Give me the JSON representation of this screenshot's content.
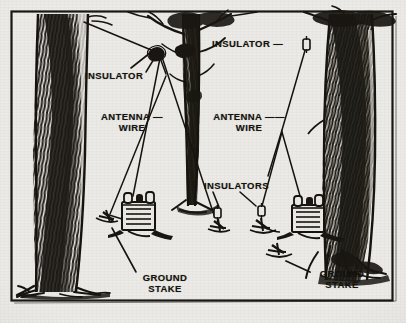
{
  "figure": {
    "background_color": "#eceae6",
    "ink_color": "#1a1814",
    "frame": {
      "color": "#1a1814"
    }
  },
  "labels": [
    {
      "id": "insulator-left",
      "name": "insulator-label-left",
      "text": "INSULATOR",
      "x": 85,
      "y": 70,
      "width": 72,
      "align": "left"
    },
    {
      "id": "insulator-right",
      "name": "insulator-label-right",
      "text": "INSULATOR —",
      "x": 212,
      "y": 38,
      "width": 90,
      "align": "left"
    },
    {
      "id": "antenna-wire-left",
      "name": "antenna-wire-label-left",
      "text": "ANTENNA —\nWIRE",
      "x": 92,
      "y": 111,
      "width": 74,
      "align": "center"
    },
    {
      "id": "antenna-wire-right",
      "name": "antenna-wire-label-right",
      "text": "ANTENNA ——\nWIRE",
      "x": 205,
      "y": 111,
      "width": 86,
      "align": "center"
    },
    {
      "id": "insulators-center",
      "name": "insulators-label",
      "text": "INSULATORS",
      "x": 204,
      "y": 180,
      "width": 80,
      "align": "left"
    },
    {
      "id": "ground-stake-left",
      "name": "ground-stake-label-left",
      "text": "GROUND\nSTAKE",
      "x": 133,
      "y": 277,
      "width": 62,
      "align": "center"
    },
    {
      "id": "ground-stake-right",
      "name": "ground-stake-label-right",
      "text": "GROUND\nSTAKE",
      "x": 312,
      "y": 272,
      "width": 62,
      "align": "center"
    }
  ],
  "scene": {
    "trees": [
      {
        "name": "tree-left",
        "role": "large foreground trunk, left support"
      },
      {
        "name": "tree-center",
        "role": "slender branching trunk, center support"
      },
      {
        "name": "tree-right",
        "role": "large trunk, right support"
      }
    ],
    "equipment": [
      {
        "name": "radio-transceiver-left",
        "role": "field radio set on ground, left"
      },
      {
        "name": "radio-transceiver-right",
        "role": "field radio set on ground, right"
      }
    ],
    "hardware": [
      {
        "name": "insulator-upper-left",
        "role": "wire insulator near left tree top"
      },
      {
        "name": "insulator-upper-right",
        "role": "wire insulator on right tree"
      },
      {
        "name": "insulator-lower-a",
        "role": "insulator above ground stake"
      },
      {
        "name": "insulator-lower-b",
        "role": "insulator above ground stake"
      },
      {
        "name": "ground-stake-1",
        "role": "stake driven into ground"
      },
      {
        "name": "ground-stake-2",
        "role": "stake driven into ground"
      },
      {
        "name": "ground-stake-3",
        "role": "stake driven into ground"
      },
      {
        "name": "ground-stake-4",
        "role": "stake driven into ground"
      }
    ]
  }
}
